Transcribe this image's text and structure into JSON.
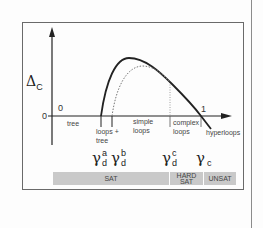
{
  "figure": {
    "y_axis_label": "Δ",
    "y_axis_label_sub": "C",
    "origin_label": "0",
    "x_start_label": "0",
    "x_end_label": "1",
    "region_labels": {
      "tree": "tree",
      "loops_tree_1": "loops +",
      "loops_tree_2": "tree",
      "simple_loops_1": "simple",
      "simple_loops_2": "loops",
      "complex_loops_1": "complex",
      "complex_loops_2": "loops",
      "hyperloops": "hyperloops"
    },
    "thresholds": [
      {
        "symbol": "γ",
        "sup": "a",
        "sub": "d"
      },
      {
        "symbol": "γ",
        "sup": "b",
        "sub": "d"
      },
      {
        "symbol": "γ",
        "sup": "c",
        "sub": "d"
      },
      {
        "symbol": "γ",
        "sup": "",
        "sub": "c"
      }
    ],
    "phases": [
      {
        "label": "SAT"
      },
      {
        "label_1": "HARD",
        "label_2": "SAT"
      },
      {
        "label": "UNSAT"
      }
    ],
    "colors": {
      "curve": "#222222",
      "dotted_curve": "#777777",
      "phase_bar": "#c9c9c9",
      "frame": "#6a6a6a"
    }
  }
}
